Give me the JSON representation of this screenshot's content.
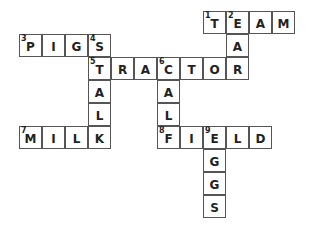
{
  "puzzle": {
    "cell_size": 23,
    "origin_x": 19,
    "origin_y": 11,
    "cells": [
      {
        "r": 0,
        "c": 8,
        "letter": "T",
        "num": "1"
      },
      {
        "r": 0,
        "c": 9,
        "letter": "E",
        "num": "2"
      },
      {
        "r": 0,
        "c": 10,
        "letter": "A",
        "num": ""
      },
      {
        "r": 0,
        "c": 11,
        "letter": "M",
        "num": ""
      },
      {
        "r": 1,
        "c": 0,
        "letter": "P",
        "num": "3"
      },
      {
        "r": 1,
        "c": 1,
        "letter": "I",
        "num": ""
      },
      {
        "r": 1,
        "c": 2,
        "letter": "G",
        "num": ""
      },
      {
        "r": 1,
        "c": 3,
        "letter": "S",
        "num": "4"
      },
      {
        "r": 1,
        "c": 9,
        "letter": "A",
        "num": ""
      },
      {
        "r": 2,
        "c": 3,
        "letter": "T",
        "num": "5"
      },
      {
        "r": 2,
        "c": 4,
        "letter": "R",
        "num": ""
      },
      {
        "r": 2,
        "c": 5,
        "letter": "A",
        "num": ""
      },
      {
        "r": 2,
        "c": 6,
        "letter": "C",
        "num": "6"
      },
      {
        "r": 2,
        "c": 7,
        "letter": "T",
        "num": ""
      },
      {
        "r": 2,
        "c": 8,
        "letter": "O",
        "num": ""
      },
      {
        "r": 2,
        "c": 9,
        "letter": "R",
        "num": ""
      },
      {
        "r": 3,
        "c": 3,
        "letter": "A",
        "num": ""
      },
      {
        "r": 3,
        "c": 6,
        "letter": "A",
        "num": ""
      },
      {
        "r": 4,
        "c": 3,
        "letter": "L",
        "num": ""
      },
      {
        "r": 4,
        "c": 6,
        "letter": "L",
        "num": ""
      },
      {
        "r": 5,
        "c": 0,
        "letter": "M",
        "num": "7"
      },
      {
        "r": 5,
        "c": 1,
        "letter": "I",
        "num": ""
      },
      {
        "r": 5,
        "c": 2,
        "letter": "L",
        "num": ""
      },
      {
        "r": 5,
        "c": 3,
        "letter": "K",
        "num": ""
      },
      {
        "r": 5,
        "c": 6,
        "letter": "F",
        "num": "8"
      },
      {
        "r": 5,
        "c": 7,
        "letter": "I",
        "num": ""
      },
      {
        "r": 5,
        "c": 8,
        "letter": "E",
        "num": "9"
      },
      {
        "r": 5,
        "c": 9,
        "letter": "L",
        "num": ""
      },
      {
        "r": 5,
        "c": 10,
        "letter": "D",
        "num": ""
      },
      {
        "r": 6,
        "c": 8,
        "letter": "G",
        "num": ""
      },
      {
        "r": 7,
        "c": 8,
        "letter": "G",
        "num": ""
      },
      {
        "r": 8,
        "c": 8,
        "letter": "S",
        "num": ""
      }
    ],
    "words": [
      {
        "num": "1",
        "dir": "across",
        "answer": "TEAM"
      },
      {
        "num": "2",
        "dir": "down",
        "answer": "EAR"
      },
      {
        "num": "3",
        "dir": "across",
        "answer": "PIGS"
      },
      {
        "num": "4",
        "dir": "down",
        "answer": "STALK"
      },
      {
        "num": "5",
        "dir": "across",
        "answer": "TRACTOR"
      },
      {
        "num": "6",
        "dir": "down",
        "answer": "CALF"
      },
      {
        "num": "7",
        "dir": "across",
        "answer": "MILK"
      },
      {
        "num": "8",
        "dir": "across",
        "answer": "FIELD"
      },
      {
        "num": "9",
        "dir": "down",
        "answer": "EGGS"
      }
    ]
  }
}
